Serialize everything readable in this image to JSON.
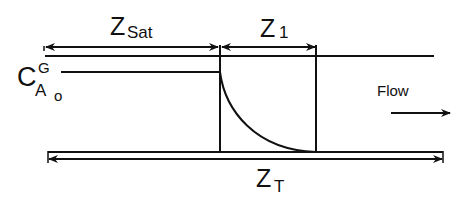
{
  "diagram": {
    "labels": {
      "z_sat_main": "Z",
      "z_sat_sub": "Sat",
      "z1_main": "Z",
      "z1_sub": "1",
      "zt_main": "Z",
      "zt_sub": "T",
      "conc_main": "C",
      "conc_sup": "G",
      "conc_sub": "A",
      "conc_subsub": "o",
      "flow": "Flow"
    },
    "colors": {
      "stroke": "#111111",
      "background": "#ffffff"
    },
    "geometry": {
      "channel_top_y": 56,
      "channel_bottom_y": 152,
      "saturated_boundary_x": 220,
      "front_end_x": 316,
      "inlet_concentration_y": 72
    }
  }
}
